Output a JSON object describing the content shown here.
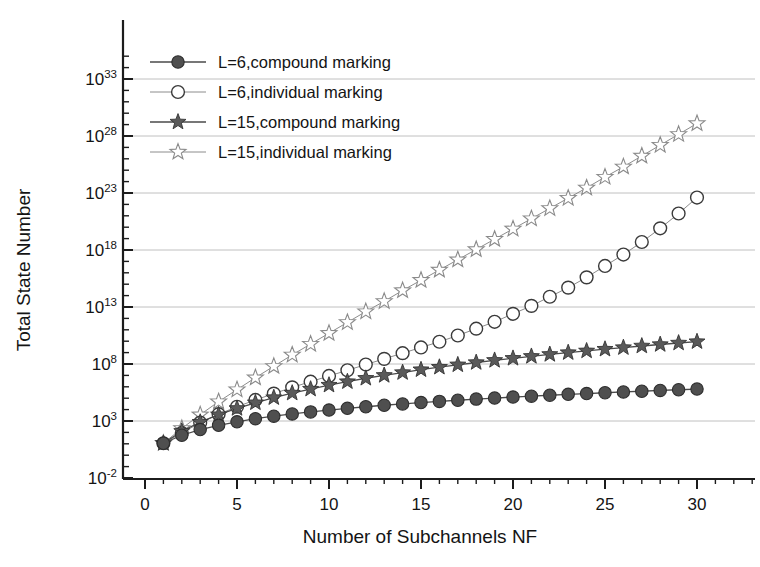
{
  "chart_data": {
    "type": "line",
    "title": "",
    "xlabel": "Number of Subchannels NF",
    "ylabel": "Total State Number",
    "xlim": [
      0,
      32
    ],
    "ylim_exponent": [
      -2,
      35.5
    ],
    "yscale": "log",
    "grid": true,
    "legend_position": "upper-left",
    "xticks": [
      0,
      5,
      10,
      15,
      20,
      25,
      30
    ],
    "xtick_labels": [
      "0",
      "5",
      "10",
      "15",
      "20",
      "25",
      "30"
    ],
    "yticks_exponent": [
      -2,
      3,
      8,
      13,
      18,
      23,
      28,
      33
    ],
    "ytick_labels": [
      "10-2",
      "103",
      "108",
      "1013",
      "1018",
      "1023",
      "1028",
      "1033"
    ],
    "ytick_mantissa": "10",
    "ytick_exponents": [
      "-2",
      "3",
      "8",
      "13",
      "18",
      "23",
      "28",
      "33"
    ],
    "x": [
      1,
      2,
      3,
      4,
      5,
      6,
      7,
      8,
      9,
      10,
      11,
      12,
      13,
      14,
      15,
      16,
      17,
      18,
      19,
      20,
      21,
      22,
      23,
      24,
      25,
      26,
      27,
      28,
      29,
      30
    ],
    "series": [
      {
        "name": "L=6,compound marking",
        "marker": "filled-circle",
        "color": "#4f4f4f",
        "log10_values": [
          1.05,
          1.75,
          2.25,
          2.62,
          2.93,
          3.2,
          3.42,
          3.62,
          3.8,
          3.96,
          4.11,
          4.25,
          4.38,
          4.5,
          4.62,
          4.72,
          4.82,
          4.92,
          5.01,
          5.1,
          5.18,
          5.26,
          5.34,
          5.41,
          5.48,
          5.55,
          5.61,
          5.68,
          5.74,
          5.8
        ]
      },
      {
        "name": "L=6,individual marking",
        "marker": "open-circle",
        "color": "#ffffff",
        "log10_values": [
          1.05,
          1.95,
          2.85,
          3.6,
          4.25,
          4.85,
          5.4,
          5.95,
          6.45,
          6.95,
          7.45,
          7.95,
          8.45,
          8.95,
          9.45,
          9.95,
          10.5,
          11.1,
          11.7,
          12.4,
          13.1,
          13.9,
          14.7,
          15.6,
          16.6,
          17.6,
          18.7,
          19.9,
          21.2,
          22.6
        ]
      },
      {
        "name": "L=15,compound marking",
        "marker": "filled-star",
        "color": "#5a5a5a",
        "log10_values": [
          1.05,
          2.1,
          2.9,
          3.55,
          4.1,
          4.6,
          5.05,
          5.45,
          5.8,
          6.15,
          6.45,
          6.75,
          7.0,
          7.25,
          7.5,
          7.72,
          7.93,
          8.13,
          8.32,
          8.5,
          8.67,
          8.84,
          9.0,
          9.15,
          9.3,
          9.44,
          9.58,
          9.71,
          9.84,
          9.96
        ]
      },
      {
        "name": "L=15,individual marking",
        "marker": "open-star",
        "color": "#ffffff",
        "log10_values": [
          1.05,
          2.35,
          3.55,
          4.7,
          5.75,
          6.8,
          7.8,
          8.8,
          9.75,
          10.7,
          11.65,
          12.6,
          13.5,
          14.45,
          15.35,
          16.25,
          17.15,
          18.05,
          18.95,
          19.85,
          20.75,
          21.65,
          22.55,
          23.45,
          24.4,
          25.3,
          26.25,
          27.2,
          28.15,
          29.1
        ]
      }
    ]
  },
  "legend": {
    "items": [
      {
        "label": "L=6,compound marking",
        "marker": "filled-circle"
      },
      {
        "label": "L=6,individual marking",
        "marker": "open-circle"
      },
      {
        "label": "L=15,compound marking",
        "marker": "filled-star"
      },
      {
        "label": "L=15,individual marking",
        "marker": "open-star"
      }
    ]
  }
}
